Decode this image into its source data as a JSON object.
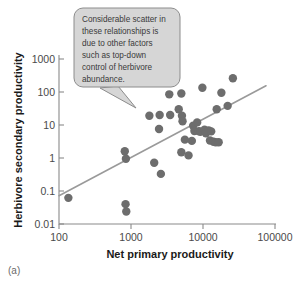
{
  "figure": {
    "panel_label": "(a)"
  },
  "callout": {
    "name": "annotation-callout",
    "lines": [
      "Considerable scatter in",
      "these relationships is",
      "due to other factors",
      "such as top-down",
      "control of herbivore",
      "abundance."
    ],
    "text": "Considerable scatter in these relationships is due to other factors such as top-down control of herbivore abundance.",
    "fill_color": "#d6d6d6",
    "border_color": "#8c8c8c"
  },
  "chart_data": {
    "type": "scatter",
    "title": "",
    "xlabel": "Net primary productivity",
    "ylabel": "Herbivore secondary productivity",
    "xscale": "log",
    "yscale": "log",
    "xlim": [
      100,
      100000
    ],
    "ylim": [
      0.01,
      1000
    ],
    "xticks": [
      100,
      1000,
      10000,
      100000
    ],
    "xticklabels": [
      "100",
      "1000",
      "10000",
      "100000"
    ],
    "yticks": [
      0.01,
      0.1,
      1,
      10,
      100,
      1000
    ],
    "yticklabels": [
      "0.01",
      "0.1",
      "1",
      "10",
      "100",
      "1000"
    ],
    "grid": false,
    "legend": false,
    "marker_color": "#6d6d6d",
    "marker_size": 4.2,
    "series": [
      {
        "name": "Herbivore productivity vs net primary productivity",
        "points": [
          [
            135,
            0.062
          ],
          [
            820,
            1.6
          ],
          [
            850,
            0.95
          ],
          [
            840,
            0.04
          ],
          [
            860,
            0.024
          ],
          [
            1800,
            19
          ],
          [
            2100,
            0.72
          ],
          [
            2500,
            20
          ],
          [
            2450,
            7.6
          ],
          [
            2600,
            0.33
          ],
          [
            3400,
            85
          ],
          [
            3500,
            20
          ],
          [
            4600,
            30
          ],
          [
            5000,
            90
          ],
          [
            5100,
            19
          ],
          [
            5200,
            13
          ],
          [
            5000,
            1.5
          ],
          [
            5600,
            3.6
          ],
          [
            6300,
            1.2
          ],
          [
            7300,
            9.5
          ],
          [
            7600,
            6.6
          ],
          [
            7000,
            3.3
          ],
          [
            8300,
            12
          ],
          [
            8800,
            6.5
          ],
          [
            9200,
            6.2
          ],
          [
            9800,
            135
          ],
          [
            10500,
            7.2
          ],
          [
            11000,
            5.6
          ],
          [
            12000,
            6.8
          ],
          [
            13000,
            6.4
          ],
          [
            12500,
            3.4
          ],
          [
            14000,
            3.1
          ],
          [
            15000,
            3.0
          ],
          [
            16500,
            3.0
          ],
          [
            15500,
            30
          ],
          [
            18000,
            95
          ],
          [
            22000,
            38
          ],
          [
            26000,
            260
          ]
        ]
      }
    ],
    "trend_line": {
      "name": "regression-line",
      "color": "#9a9a9a",
      "x_start": 100,
      "y_start": 0.072,
      "x_end": 75000,
      "y_end": 155
    }
  }
}
